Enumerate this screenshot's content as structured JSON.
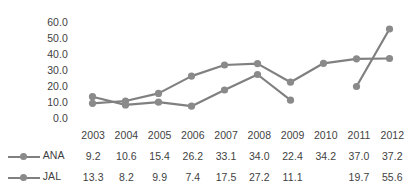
{
  "chart_data": {
    "type": "line",
    "title": "",
    "subtitle": "",
    "xlabel": "",
    "ylabel": "",
    "categories": [
      "2003",
      "2004",
      "2005",
      "2006",
      "2007",
      "2008",
      "2009",
      "2010",
      "2011",
      "2012"
    ],
    "ylim": [
      0,
      60
    ],
    "ytick_labels": [
      "60.0",
      "50.0",
      "40.0",
      "30.0",
      "20.0",
      "10.0",
      "0.0"
    ],
    "ytick_values": [
      60,
      50,
      40,
      30,
      20,
      10,
      0
    ],
    "grid": false,
    "legend_position": "bottom-table",
    "marker": "circle",
    "series": [
      {
        "name": "ANA",
        "color": "#808080",
        "values": [
          9.2,
          10.6,
          15.4,
          26.2,
          33.1,
          34.0,
          22.4,
          34.2,
          37.0,
          37.2
        ],
        "labels": [
          "9.2",
          "10.6",
          "15.4",
          "26.2",
          "33.1",
          "34.0",
          "22.4",
          "34.2",
          "37.0",
          "37.2"
        ]
      },
      {
        "name": "JAL",
        "color": "#808080",
        "values": [
          13.3,
          8.2,
          9.9,
          7.4,
          17.5,
          27.2,
          11.1,
          null,
          19.7,
          55.6
        ],
        "labels": [
          "13.3",
          "8.2",
          "9.9",
          "7.4",
          "17.5",
          "27.2",
          "11.1",
          "",
          "19.7",
          "55.6"
        ]
      }
    ],
    "colors": {
      "line": "#808080",
      "marker": "#8a8a8a",
      "text": "#3f3f3f",
      "background": "#ffffff"
    }
  }
}
